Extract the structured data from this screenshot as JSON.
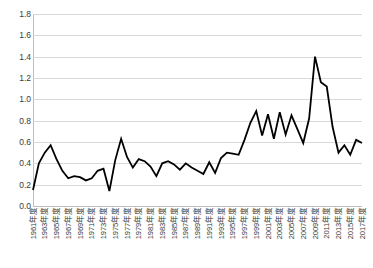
{
  "chart_data": {
    "type": "line",
    "title": "",
    "subtitle": "",
    "xlabel": "",
    "ylabel": "",
    "ylim": [
      0.0,
      1.8
    ],
    "ytick_step": 0.2,
    "grid": true,
    "legend": "none",
    "line_color": "#000000",
    "line_width": 1.8,
    "gridline_color": "#d9d9d9",
    "axis_color": "#bfbfbf",
    "label_color": "#3a3a3a",
    "x_tick_interval": 2,
    "y_ticks": [
      "0.0",
      "0.2",
      "0.4",
      "0.6",
      "0.8",
      "1.0",
      "1.2",
      "1.4",
      "1.6",
      "1.8"
    ],
    "x_tick_labels": [
      "1961年度",
      "1963年度",
      "1965年度",
      "1967年度",
      "1969年度",
      "1971年度",
      "1973年度",
      "1975年度",
      "1977年度",
      "1979年度",
      "1981年度",
      "1983年度",
      "1985年度",
      "1987年度",
      "1989年度",
      "1991年度",
      "1993年度",
      "1995年度",
      "1997年度",
      "1999年度",
      "2001年度",
      "2003年度",
      "2005年度",
      "2007年度",
      "2009年度",
      "2011年度",
      "2013年度",
      "2015年度",
      "2017年度"
    ],
    "categories": [
      "1961年度",
      "1962年度",
      "1963年度",
      "1964年度",
      "1965年度",
      "1966年度",
      "1967年度",
      "1968年度",
      "1969年度",
      "1970年度",
      "1971年度",
      "1972年度",
      "1973年度",
      "1974年度",
      "1975年度",
      "1976年度",
      "1977年度",
      "1978年度",
      "1979年度",
      "1980年度",
      "1981年度",
      "1982年度",
      "1983年度",
      "1984年度",
      "1985年度",
      "1986年度",
      "1987年度",
      "1988年度",
      "1989年度",
      "1990年度",
      "1991年度",
      "1992年度",
      "1993年度",
      "1994年度",
      "1995年度",
      "1996年度",
      "1997年度",
      "1998年度",
      "1999年度",
      "2000年度",
      "2001年度",
      "2002年度",
      "2003年度",
      "2004年度",
      "2005年度",
      "2006年度",
      "2007年度",
      "2008年度",
      "2009年度",
      "2010年度",
      "2011年度",
      "2012年度",
      "2013年度",
      "2014年度",
      "2015年度",
      "2016年度",
      "2017年度"
    ],
    "values": [
      0.15,
      0.4,
      0.5,
      0.57,
      0.44,
      0.33,
      0.26,
      0.28,
      0.27,
      0.24,
      0.26,
      0.33,
      0.35,
      0.14,
      0.43,
      0.63,
      0.46,
      0.36,
      0.44,
      0.42,
      0.37,
      0.28,
      0.4,
      0.42,
      0.39,
      0.34,
      0.4,
      0.36,
      0.33,
      0.3,
      0.41,
      0.31,
      0.45,
      0.5,
      0.49,
      0.48,
      0.62,
      0.78,
      0.89,
      0.66,
      0.86,
      0.63,
      0.88,
      0.67,
      0.85,
      0.72,
      0.59,
      0.82,
      1.4,
      1.16,
      1.12,
      0.74,
      0.5,
      0.57,
      0.48,
      0.62,
      0.59
    ]
  }
}
